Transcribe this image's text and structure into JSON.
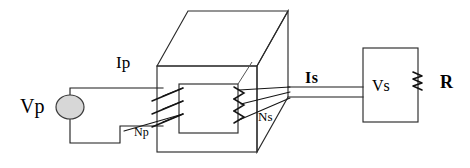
{
  "figure": {
    "type": "transformer-circuit-schematic",
    "background_color": "#ffffff",
    "line_color": "#1a1a1a",
    "source_fill_color": "#d7d7d7"
  },
  "labels": {
    "primary_voltage": "Vp",
    "primary_current": "Ip",
    "primary_turns": "Np",
    "secondary_turns": "Ns",
    "secondary_current": "Is",
    "secondary_voltage": "Vs",
    "load_resistor": "R"
  },
  "components": {
    "source": {
      "name": "ac-source",
      "label": "Vp",
      "shape": "ellipse",
      "cx": 70,
      "cy": 107,
      "rx": 14,
      "ry": 12
    },
    "core": {
      "name": "transformer-core",
      "shape": "3d-rectangular-box-with-window",
      "front_face": {
        "x": 157,
        "y": 66,
        "width": 100,
        "height": 86
      },
      "window": {
        "x": 179,
        "y": 84,
        "width": 59,
        "height": 49
      },
      "depth_offset_x": 31,
      "depth_offset_y": -55
    },
    "primary_winding": {
      "name": "primary-winding",
      "turns_drawn": 3,
      "leg": "left"
    },
    "secondary_winding": {
      "name": "secondary-winding",
      "turns_drawn": 3,
      "leg": "right"
    },
    "output_box": {
      "name": "secondary-voltage-box",
      "label": "Vs",
      "x": 363,
      "y": 48,
      "width": 55,
      "height": 74
    },
    "load": {
      "name": "load-resistor",
      "label": "R",
      "shape": "zigzag",
      "x": 418,
      "y_top": 72,
      "y_bottom": 92
    }
  },
  "label_positions": {
    "vp": {
      "x": 20,
      "y": 97
    },
    "ip": {
      "x": 116,
      "y": 55
    },
    "np": {
      "x": 134,
      "y": 126
    },
    "ns": {
      "x": 258,
      "y": 112
    },
    "is": {
      "x": 305,
      "y": 73
    },
    "vs": {
      "x": 373,
      "y": 78
    },
    "r": {
      "x": 440,
      "y": 75
    }
  }
}
